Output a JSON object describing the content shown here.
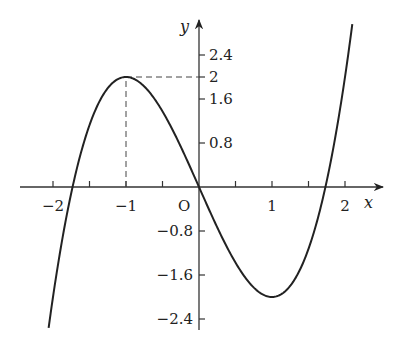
{
  "chart_data": {
    "type": "line",
    "title": "",
    "function": "y = x^3 - 3x",
    "xlabel": "x",
    "ylabel": "y",
    "origin_label": "O",
    "x_ticks": [
      -2,
      -1.5,
      -1,
      -0.5,
      0.5,
      1,
      1.5,
      2
    ],
    "x_tick_labels": [
      {
        "value": -2,
        "label": "−2"
      },
      {
        "value": -1,
        "label": "−1"
      },
      {
        "value": 1,
        "label": "1"
      },
      {
        "value": 2,
        "label": "2"
      }
    ],
    "y_ticks": [
      2.4,
      2,
      1.6,
      0.8,
      -0.8,
      -1.6,
      -2.4
    ],
    "y_tick_labels": [
      {
        "value": 2.4,
        "label": "2.4"
      },
      {
        "value": 2,
        "label": "2"
      },
      {
        "value": 1.6,
        "label": "1.6"
      },
      {
        "value": 0.8,
        "label": "0.8"
      },
      {
        "value": -0.8,
        "label": "−0.8"
      },
      {
        "value": -1.6,
        "label": "−1.6"
      },
      {
        "value": -2.4,
        "label": "−2.4"
      }
    ],
    "xlim": [
      -2.45,
      2.5
    ],
    "ylim": [
      -2.6,
      3.0
    ],
    "series": [
      {
        "name": "f(x)",
        "x": [
          -2.06,
          -2,
          -1.732,
          -1.5,
          -1,
          -0.5,
          0,
          0.5,
          1,
          1.5,
          1.732,
          2,
          2.1
        ],
        "y": [
          -2.56,
          -2,
          0,
          1.125,
          2,
          1.375,
          0,
          -1.375,
          -2,
          -1.125,
          0,
          2,
          2.96
        ]
      }
    ],
    "annotations": [
      {
        "type": "dashed-vertical",
        "from": [
          -1,
          0
        ],
        "to": [
          -1,
          2
        ]
      },
      {
        "type": "dashed-horizontal",
        "from": [
          -1,
          2
        ],
        "to": [
          0,
          2
        ]
      }
    ],
    "grid": false,
    "legend": null
  }
}
